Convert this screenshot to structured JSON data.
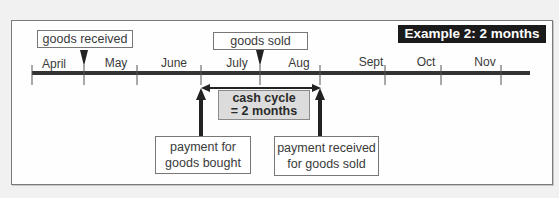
{
  "diagram": {
    "title_badge": "Example 2: 2 months",
    "timeline": {
      "months": [
        "April",
        "May",
        "June",
        "July",
        "Aug",
        "Sept",
        "Oct",
        "Nov"
      ]
    },
    "events_above": [
      {
        "label": "goods received",
        "at_boundary": "April/May"
      },
      {
        "label": "goods sold",
        "at": "mid-July"
      }
    ],
    "events_below": [
      {
        "label_line1": "payment for",
        "label_line2": "goods bought",
        "at_boundary": "June/July"
      },
      {
        "label_line1": "payment received",
        "label_line2": "for goods sold",
        "at_boundary": "Aug/Sept"
      }
    ],
    "cash_cycle": {
      "line1": "cash cycle",
      "line2": "= 2 months",
      "duration_months": 2
    },
    "colors": {
      "badge_bg": "#1b1b1b",
      "badge_text": "#ffffff",
      "cycle_box_bg": "#dcdcdc",
      "line": "#333333",
      "page_bg": "#f1f1f1"
    }
  }
}
